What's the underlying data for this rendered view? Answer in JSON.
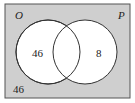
{
  "diagram": {
    "type": "venn",
    "universe_label": "",
    "sets": [
      {
        "label": "O",
        "only_value": "46"
      },
      {
        "label": "P",
        "only_value": "8"
      }
    ],
    "intersection_value": "",
    "outside_value": "46",
    "colors": {
      "universe_fill": "#cfcfcf",
      "circle_fill": "#ffffff",
      "stroke": "#333333"
    }
  }
}
